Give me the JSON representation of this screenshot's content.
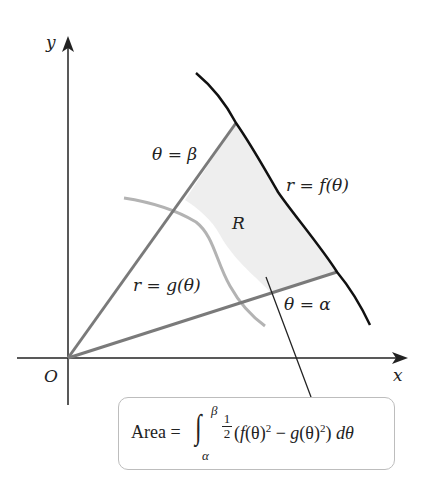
{
  "diagram": {
    "axes": {
      "x_label": "x",
      "y_label": "y",
      "origin_label": "O"
    },
    "labels": {
      "ray_beta": "θ = β",
      "ray_alpha": "θ = α",
      "outer_curve": "r = f(θ)",
      "inner_curve": "r = g(θ)",
      "region": "R"
    },
    "formula": {
      "lhs": "Area =",
      "integral_sign": "∫",
      "upper_limit": "β",
      "lower_limit": "α",
      "frac_num": "1",
      "frac_den": "2",
      "body_open": "(",
      "f": "f",
      "theta1": "(θ)",
      "exp1": "2",
      "minus": " − ",
      "g": "g",
      "theta2": "(θ)",
      "exp2": "2",
      "close_d": ") ",
      "dtheta": "dθ"
    },
    "colors": {
      "axis": "#222222",
      "outer_curve": "#111111",
      "inner_curve": "#b3b3b3",
      "rays": "#7a7a7a",
      "region_fill": "#eeeeee",
      "box_border": "#bdbdbd"
    }
  }
}
